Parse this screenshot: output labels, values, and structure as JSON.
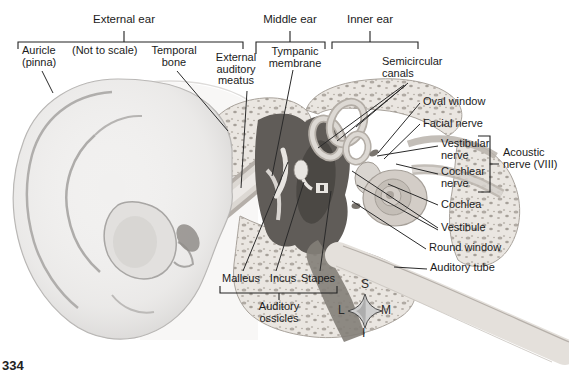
{
  "figure": {
    "headers": {
      "external_ear": "External ear",
      "middle_ear": "Middle ear",
      "inner_ear": "Inner ear"
    },
    "labels": {
      "auricle": "Auricle\n(pinna)",
      "not_to_scale": "(Not to scale)",
      "temporal_bone": "Temporal\nbone",
      "external_auditory_meatus": "External\nauditory\nmeatus",
      "tympanic_membrane": "Tympanic\nmembrane",
      "semicircular_canals": "Semicircular\ncanals",
      "oval_window": "Oval window",
      "facial_nerve": "Facial nerve",
      "vestibular_nerve": "Vestibular\nnerve",
      "cochlear_nerve": "Cochlear\nnerve",
      "acoustic_nerve": "Acoustic\nnerve (VIII)",
      "cochlea": "Cochlea",
      "vestibule": "Vestibule",
      "round_window": "Round window",
      "auditory_tube": "Auditory tube",
      "malleus": "Malleus",
      "incus": "Incus",
      "stapes": "Stapes",
      "auditory_ossicles": "Auditory\nossicles"
    },
    "compass": {
      "top": "S",
      "bottom": "I",
      "left": "L",
      "right": "M"
    },
    "page_number": "334",
    "colors": {
      "ink": "#1b1b1b",
      "paper": "#ffffff",
      "bone_tint": "#e9e5e0",
      "cavity_dark": "#5e5a56"
    }
  }
}
